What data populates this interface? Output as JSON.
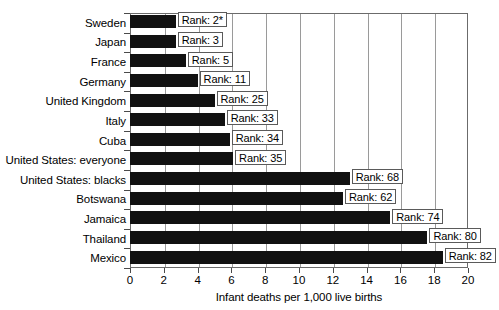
{
  "chart_data": {
    "type": "bar",
    "orientation": "horizontal",
    "title": "",
    "xlabel": "Infant deaths per 1,000 live births",
    "ylabel": "",
    "xlim": [
      0,
      20
    ],
    "xticks": [
      0,
      2,
      4,
      6,
      8,
      10,
      12,
      14,
      16,
      18,
      20
    ],
    "xtick_labels": [
      "0",
      "2",
      "4",
      "6",
      "8",
      "10",
      "12",
      "14",
      "16",
      "18",
      "20"
    ],
    "grid": true,
    "grid_axis": "x",
    "legend": false,
    "bar_color": "#111111",
    "categories": [
      "Sweden",
      "Japan",
      "France",
      "Germany",
      "United Kingdom",
      "Italy",
      "Cuba",
      "United States: everyone",
      "United States: blacks",
      "Botswana",
      "Jamaica",
      "Thailand",
      "Mexico"
    ],
    "values": [
      2.7,
      2.7,
      3.3,
      4.0,
      5.0,
      5.6,
      5.9,
      6.1,
      13.0,
      12.6,
      15.4,
      17.6,
      18.5
    ],
    "annotations": [
      "Rank: 2*",
      "Rank: 3",
      "Rank: 5",
      "Rank: 11",
      "Rank: 25",
      "Rank: 33",
      "Rank: 34",
      "Rank: 35",
      "Rank: 68",
      "Rank: 62",
      "Rank: 74",
      "Rank: 80",
      "Rank: 82"
    ]
  }
}
